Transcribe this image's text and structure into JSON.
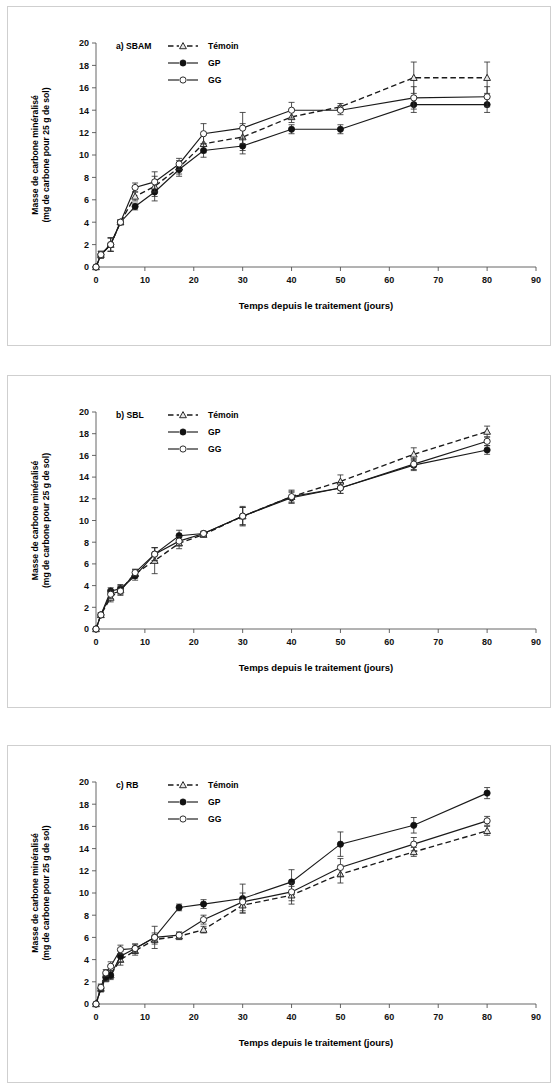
{
  "figure": {
    "panel_count": 3
  },
  "axes": {
    "xlabel": "Temps depuis le traitement (jours)",
    "ylabel_line1": "Masse de carbone minéralisé",
    "ylabel_line2": "(mg de carbone pour 25 g de sol)",
    "xlim": [
      0,
      90
    ],
    "ylim": [
      0,
      20
    ],
    "xticks": [
      0,
      10,
      20,
      30,
      40,
      50,
      60,
      70,
      80,
      90
    ],
    "yticks": [
      0,
      2,
      4,
      6,
      8,
      10,
      12,
      14,
      16,
      18,
      20
    ],
    "xtick_labels": [
      "0",
      "10",
      "20",
      "30",
      "40",
      "50",
      "60",
      "70",
      "80",
      "90"
    ],
    "ytick_labels": [
      "0",
      "2",
      "4",
      "6",
      "8",
      "10",
      "12",
      "14",
      "16",
      "18",
      "20"
    ]
  },
  "legend": {
    "entries": [
      {
        "label": "Témoin",
        "style": "dashed",
        "marker": "open-triangle"
      },
      {
        "label": "GP",
        "style": "solid",
        "marker": "filled-circle"
      },
      {
        "label": "GG",
        "style": "solid",
        "marker": "open-circle"
      }
    ]
  },
  "panels": [
    {
      "tag": "a) SBAM",
      "id": "a"
    },
    {
      "tag": "b) SBL",
      "id": "b"
    },
    {
      "tag": "c) RB",
      "id": "c"
    }
  ],
  "chart_data": [
    {
      "type": "line",
      "title": "a) SBAM",
      "xlabel": "Temps depuis le traitement (jours)",
      "ylabel": "Masse de carbone minéralisé (mg de carbone pour 25 g de sol)",
      "xlim": [
        0,
        90
      ],
      "ylim": [
        0,
        20
      ],
      "grid": false,
      "legend_position": "top-left-inside",
      "x": [
        0,
        1,
        3,
        5,
        8,
        12,
        17,
        22,
        30,
        40,
        50,
        65,
        80
      ],
      "series": [
        {
          "name": "Témoin",
          "style": "dashed",
          "marker": "open-triangle",
          "values": [
            0.0,
            1.1,
            2.0,
            4.0,
            6.3,
            7.2,
            8.9,
            11.0,
            11.6,
            13.4,
            14.3,
            16.9,
            16.9
          ],
          "errors": [
            0.0,
            0.3,
            0.6,
            0.2,
            0.4,
            0.9,
            0.6,
            0.8,
            1.2,
            0.5,
            0.3,
            1.4,
            1.4
          ]
        },
        {
          "name": "GP",
          "style": "solid",
          "marker": "filled-circle",
          "values": [
            0.0,
            1.1,
            2.0,
            4.0,
            5.4,
            6.7,
            8.7,
            10.4,
            10.8,
            12.3,
            12.3,
            14.5,
            14.5
          ],
          "errors": [
            0.0,
            0.3,
            0.6,
            0.2,
            0.3,
            0.8,
            0.6,
            0.6,
            0.7,
            0.4,
            0.4,
            0.7,
            0.7
          ]
        },
        {
          "name": "GG",
          "style": "solid",
          "marker": "open-circle",
          "values": [
            0.0,
            1.1,
            2.0,
            4.0,
            7.1,
            7.6,
            9.2,
            11.9,
            12.4,
            14.0,
            14.0,
            15.1,
            15.2
          ],
          "errors": [
            0.0,
            0.3,
            0.6,
            0.2,
            0.4,
            0.9,
            0.5,
            0.9,
            1.4,
            0.7,
            0.4,
            1.0,
            0.9
          ]
        }
      ]
    },
    {
      "type": "line",
      "title": "b) SBL",
      "xlabel": "Temps depuis le traitement (jours)",
      "ylabel": "Masse de carbone minéralisé (mg de carbone pour 25 g de sol)",
      "xlim": [
        0,
        90
      ],
      "ylim": [
        0,
        20
      ],
      "grid": false,
      "legend_position": "top-left-inside",
      "x": [
        0,
        1,
        3,
        5,
        8,
        12,
        17,
        22,
        30,
        40,
        50,
        65,
        80
      ],
      "series": [
        {
          "name": "Témoin",
          "style": "dashed",
          "marker": "open-triangle",
          "values": [
            0.0,
            1.3,
            2.9,
            3.6,
            5.1,
            6.3,
            7.9,
            8.7,
            10.4,
            12.2,
            13.6,
            16.1,
            18.2
          ],
          "errors": [
            0.0,
            0.2,
            0.4,
            0.4,
            0.4,
            1.2,
            0.5,
            0.2,
            0.9,
            0.6,
            0.6,
            0.6,
            0.5
          ]
        },
        {
          "name": "GP",
          "style": "solid",
          "marker": "filled-circle",
          "values": [
            0.0,
            1.3,
            3.5,
            3.7,
            4.9,
            6.9,
            8.6,
            8.8,
            10.4,
            12.1,
            13.0,
            15.1,
            16.5
          ],
          "errors": [
            0.0,
            0.2,
            0.3,
            0.4,
            0.4,
            0.6,
            0.5,
            0.2,
            0.8,
            0.5,
            0.5,
            0.5,
            0.4
          ]
        },
        {
          "name": "GG",
          "style": "solid",
          "marker": "open-circle",
          "values": [
            0.0,
            1.3,
            3.2,
            3.5,
            5.2,
            6.9,
            8.1,
            8.8,
            10.4,
            12.2,
            13.0,
            15.2,
            17.3
          ],
          "errors": [
            0.0,
            0.2,
            0.4,
            0.4,
            0.3,
            0.6,
            0.4,
            0.2,
            0.8,
            0.5,
            0.5,
            0.5,
            0.4
          ]
        }
      ]
    },
    {
      "type": "line",
      "title": "c) RB",
      "xlabel": "Temps depuis le traitement (jours)",
      "ylabel": "Masse de carbone minéralisé (mg de carbone pour 25 g de sol)",
      "xlim": [
        0,
        90
      ],
      "ylim": [
        0,
        20
      ],
      "grid": false,
      "legend_position": "top-left-inside",
      "x": [
        0,
        1,
        2,
        3,
        5,
        8,
        12,
        17,
        22,
        30,
        40,
        50,
        65,
        80
      ],
      "series": [
        {
          "name": "Témoin",
          "style": "dashed",
          "marker": "open-triangle",
          "values": [
            0.0,
            1.4,
            2.3,
            2.6,
            4.0,
            4.8,
            5.8,
            6.1,
            6.7,
            8.9,
            9.8,
            11.7,
            13.7,
            15.6
          ],
          "errors": [
            0.0,
            0.3,
            0.3,
            0.4,
            0.5,
            0.4,
            0.4,
            0.3,
            0.3,
            0.7,
            0.8,
            0.8,
            0.4,
            0.4
          ]
        },
        {
          "name": "GP",
          "style": "solid",
          "marker": "filled-circle",
          "values": [
            0.0,
            1.4,
            2.4,
            2.6,
            4.3,
            5.0,
            6.0,
            8.7,
            9.0,
            9.5,
            11.0,
            14.4,
            16.1,
            19.0
          ],
          "errors": [
            0.0,
            0.3,
            0.3,
            0.3,
            0.5,
            0.4,
            1.0,
            0.3,
            0.4,
            1.3,
            1.1,
            1.1,
            0.7,
            0.5
          ]
        },
        {
          "name": "GG",
          "style": "solid",
          "marker": "open-circle",
          "values": [
            0.0,
            1.5,
            2.8,
            3.4,
            4.9,
            5.0,
            6.0,
            6.2,
            7.6,
            9.2,
            10.1,
            12.3,
            14.4,
            16.5
          ],
          "errors": [
            0.0,
            0.3,
            0.3,
            0.4,
            0.4,
            0.4,
            0.4,
            0.3,
            0.4,
            0.8,
            0.8,
            0.8,
            0.6,
            0.4
          ]
        }
      ]
    }
  ]
}
